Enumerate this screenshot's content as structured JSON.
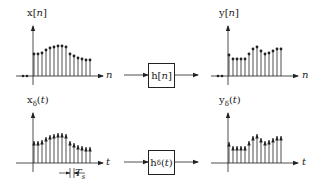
{
  "top_row": {
    "input": {
      "label": "x[n]",
      "axis_label": "n",
      "samples": [
        22,
        22,
        23,
        26,
        28,
        29,
        30,
        30,
        29,
        22,
        20,
        18,
        17,
        16,
        16
      ],
      "negative_samples": 2
    },
    "system": {
      "label": "h[n]"
    },
    "output": {
      "label": "y[n]",
      "axis_label": "n",
      "samples": [
        21,
        17,
        17,
        17,
        17,
        22,
        27,
        29,
        25,
        22,
        23,
        25,
        27,
        27
      ],
      "negative_samples": 2
    }
  },
  "bottom_row": {
    "input": {
      "label": "xδ(t)",
      "axis_label": "t",
      "samples": [
        22,
        22,
        23,
        26,
        28,
        29,
        30,
        30,
        29,
        22,
        20,
        18,
        17,
        16,
        16
      ],
      "spacing_label": "Ts"
    },
    "system": {
      "label": "hδ(t)"
    },
    "output": {
      "label": "yδ(t)",
      "axis_label": "t",
      "samples": [
        21,
        17,
        17,
        17,
        17,
        22,
        27,
        29,
        25,
        22,
        23,
        25,
        27,
        27
      ]
    }
  },
  "colors": {
    "ink": "#222222",
    "background": "#ffffff"
  }
}
